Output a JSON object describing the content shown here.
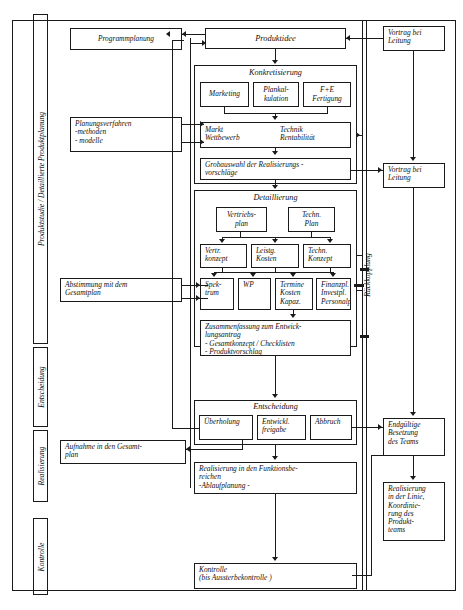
{
  "diagram": {
    "phase_labels": [
      {
        "id": "produktstudie",
        "label": "Produktstudie / Detaillierte Produktplanung"
      },
      {
        "id": "entscheidung",
        "label": "Entscheidung"
      },
      {
        "id": "realisierung",
        "label": "Realisierung"
      },
      {
        "id": "kontrolle",
        "label": "Kontrolle"
      }
    ],
    "feedback_label": "Rückkopplung",
    "left_column": [
      {
        "id": "programmplanung",
        "label": "Programmplanung"
      },
      {
        "id": "planungsverfahren",
        "label": "Planungsverfahren\n-methoden\n- modelle"
      },
      {
        "id": "abstimmung",
        "label": "Abstimmung mit dem\nGesamtplan"
      },
      {
        "id": "aufnahme",
        "label": "Aufnahme in den Gesamt-\nplan"
      }
    ],
    "center_column": {
      "produktidee": "Produktidee",
      "konkretisierung": {
        "header": "Konkretisierung",
        "children": [
          "Marketing",
          "Plankal-\nkulation",
          "F+E\nFertigung"
        ],
        "row2": [
          "Markt\nWettbewerb",
          "Technik\nRentabilität"
        ],
        "grobauswahl": "Grobauswahl der Realisierungs -\nvorschläge"
      },
      "detaillierung": {
        "header": "Detaillierung",
        "row1": [
          "Vertriebs-\nplan",
          "Techn.\nPlan"
        ],
        "row2": [
          "Vertr.\nkonzept",
          "Leistg.\nKosten",
          "Techn.\nKonzept"
        ],
        "row3": [
          "Spek-\ntrum",
          "WP",
          "Termine\nKosten\nKapaz.",
          "Finanzpl.\nInvestpl.\nPersonalpl."
        ],
        "zusammenfassung": "Zusammenfassung zum Entwick-\nlungsantrag\n- Gesamtkonzept / Checklisten\n- Produktvorschlag"
      },
      "entscheidung": {
        "header": "Entscheidung",
        "children": [
          "Überholung",
          "Entwickl.\nfreigabe",
          "Abbruch"
        ]
      },
      "realisierung": "Realisierung in den Funktionsbe-\nreichen\n         -Ablaufplanung -",
      "kontrolle": "Kontrolle\n(bis Aussterbekontrolle )"
    },
    "right_column": [
      {
        "id": "vortrag-1",
        "label": "Vortrag bei\nLeitung"
      },
      {
        "id": "vortrag-2",
        "label": "Vortrag bei\nLeitung"
      },
      {
        "id": "endgueltige",
        "label": "Endgültige\nBesetzung\ndes Teams"
      },
      {
        "id": "realisierung-linie",
        "label": "Realisierung\nin der Linie,\nKoordinie-\nrung des\nProdukt-\nteams"
      }
    ],
    "colors": {
      "ink": "#1a1a1a",
      "paper": "#ffffff"
    }
  }
}
